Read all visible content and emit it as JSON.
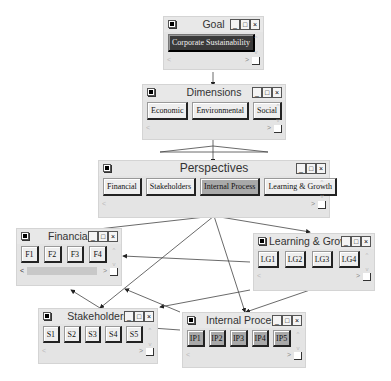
{
  "windows": {
    "goal": {
      "title": "Goal",
      "buttons": [
        "Corporate Sustainability"
      ]
    },
    "dimensions": {
      "title": "Dimensions",
      "buttons": [
        "Economic",
        "Environmental",
        "Social"
      ]
    },
    "perspectives": {
      "title": "Perspectives",
      "buttons": [
        "Financial",
        "Stakeholders",
        "Internal Process",
        "Learning & Growth"
      ]
    },
    "financial": {
      "title": "Financial",
      "buttons": [
        "F1",
        "F2",
        "F3",
        "F4"
      ]
    },
    "learning": {
      "title": "Learning & Growth",
      "buttons": [
        "LG1",
        "LG2",
        "LG3",
        "LG4"
      ]
    },
    "stakeholders": {
      "title": "Stakeholders",
      "buttons": [
        "S1",
        "S2",
        "S3",
        "S4",
        "S5"
      ]
    },
    "internal": {
      "title": "Internal Process",
      "buttons": [
        "IP1",
        "IP2",
        "IP3",
        "IP4",
        "IP5"
      ]
    }
  },
  "window_controls": {
    "minimize": "_",
    "maximize": "□",
    "close": "×"
  },
  "scroll_glyphs": {
    "up": "^",
    "down": "v",
    "left": "<",
    "right": ">"
  },
  "colors": {
    "background": "#ffffff",
    "window": "#e4e4e4",
    "selected_button": "#3a3a3a",
    "highlight_button": "#a9a9a9",
    "line": "#333333"
  }
}
